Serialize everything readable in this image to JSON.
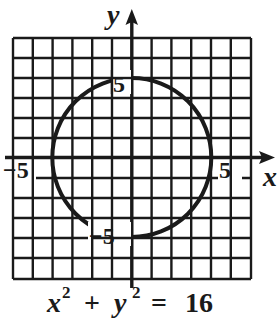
{
  "graph": {
    "x_axis_label": "x",
    "y_axis_label": "y",
    "tick_labels": {
      "x_neg": "−5",
      "x_pos": "5",
      "y_pos": "5",
      "y_neg": "−5"
    },
    "grid": {
      "columns": 12,
      "rows": 12,
      "x_range": [
        -6,
        6
      ],
      "y_range": [
        -6,
        6
      ]
    },
    "circle": {
      "center": [
        0,
        0
      ],
      "radius": 4
    },
    "colors": {
      "ink": "#1a1a1a",
      "background": "#ffffff"
    }
  },
  "equation": {
    "x": "x",
    "x_exp": "2",
    "plus": "+",
    "y": "y",
    "y_exp": "2",
    "equals": "=",
    "rhs": "16"
  }
}
